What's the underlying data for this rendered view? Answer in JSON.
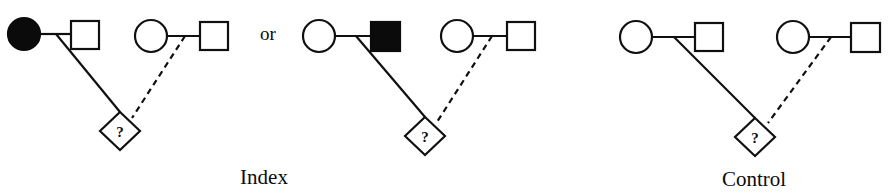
{
  "figure": {
    "background_color": "#ffffff",
    "stroke_color": "#101010",
    "fill_color": "#0b0b0b",
    "width": 890,
    "height": 194
  },
  "conjunction": {
    "label": "or",
    "x": 268,
    "y": 33
  },
  "captions": [
    {
      "id": "index",
      "label": "Index",
      "x": 264,
      "y": 184
    },
    {
      "id": "control",
      "label": "Control",
      "x": 754,
      "y": 186
    }
  ],
  "offspring_symbol": "?",
  "legend": {
    "filled_meaning": "affected individual",
    "open_meaning": "unaffected individual",
    "diamond_meaning": "offspring of unspecified sex",
    "solid_line_meaning": "biological descent",
    "dashed_line_meaning": "uncertain or non-biological descent"
  },
  "pedigrees": [
    {
      "id": "index-left",
      "group": "index",
      "circle": {
        "cx": 24,
        "cy": 34,
        "r": 16,
        "fill": "filled",
        "sex": "female"
      },
      "square": {
        "x": 71,
        "y": 21,
        "size": 28,
        "fill": "open",
        "sex": "male"
      },
      "mating_line": {
        "x1": 40,
        "y1": 34,
        "x2": 71,
        "y2": 34
      },
      "descent": {
        "style": "solid",
        "x1": 56,
        "y1": 34,
        "x2": 120,
        "y2": 112
      },
      "diamond": {
        "cx": 120,
        "cy": 131,
        "rx": 20,
        "ry": 19,
        "label": "?"
      }
    },
    {
      "id": "index-left-partner",
      "group": "index",
      "circle": {
        "cx": 151,
        "cy": 36,
        "r": 16,
        "fill": "open",
        "sex": "female"
      },
      "square": {
        "x": 200,
        "y": 22,
        "size": 28,
        "fill": "open",
        "sex": "male"
      },
      "mating_line": {
        "x1": 167,
        "y1": 36,
        "x2": 200,
        "y2": 36
      },
      "descent": {
        "style": "dashed",
        "x1": 185,
        "y1": 36,
        "x2": 132,
        "y2": 118
      },
      "diamond": null
    },
    {
      "id": "index-right",
      "group": "index",
      "circle": {
        "cx": 319,
        "cy": 36,
        "r": 16,
        "fill": "open",
        "sex": "female"
      },
      "square": {
        "x": 371,
        "y": 22,
        "size": 29,
        "fill": "filled",
        "sex": "male"
      },
      "mating_line": {
        "x1": 335,
        "y1": 36,
        "x2": 371,
        "y2": 36
      },
      "descent": {
        "style": "solid",
        "x1": 356,
        "y1": 36,
        "x2": 425,
        "y2": 117
      },
      "diamond": {
        "cx": 425,
        "cy": 136,
        "rx": 20,
        "ry": 19,
        "label": "?"
      }
    },
    {
      "id": "index-right-partner",
      "group": "index",
      "circle": {
        "cx": 457,
        "cy": 36,
        "r": 16,
        "fill": "open",
        "sex": "female"
      },
      "square": {
        "x": 507,
        "y": 22,
        "size": 28,
        "fill": "open",
        "sex": "male"
      },
      "mating_line": {
        "x1": 473,
        "y1": 36,
        "x2": 507,
        "y2": 36
      },
      "descent": {
        "style": "dashed",
        "x1": 492,
        "y1": 36,
        "x2": 437,
        "y2": 122
      },
      "diamond": null
    },
    {
      "id": "control-left",
      "group": "control",
      "circle": {
        "cx": 636,
        "cy": 37,
        "r": 16,
        "fill": "open",
        "sex": "female"
      },
      "square": {
        "x": 695,
        "y": 23,
        "size": 28,
        "fill": "open",
        "sex": "male"
      },
      "mating_line": {
        "x1": 652,
        "y1": 37,
        "x2": 695,
        "y2": 37
      },
      "descent": {
        "style": "solid",
        "x1": 674,
        "y1": 37,
        "x2": 755,
        "y2": 118
      },
      "diamond": {
        "cx": 755,
        "cy": 137,
        "rx": 20,
        "ry": 19,
        "label": "?"
      }
    },
    {
      "id": "control-right",
      "group": "control",
      "circle": {
        "cx": 793,
        "cy": 37,
        "r": 16,
        "fill": "open",
        "sex": "female"
      },
      "square": {
        "x": 851,
        "y": 23,
        "size": 29,
        "fill": "open",
        "sex": "male"
      },
      "mating_line": {
        "x1": 809,
        "y1": 37,
        "x2": 851,
        "y2": 37
      },
      "descent": {
        "style": "dashed",
        "x1": 831,
        "y1": 37,
        "x2": 768,
        "y2": 123
      },
      "diamond": null
    }
  ]
}
